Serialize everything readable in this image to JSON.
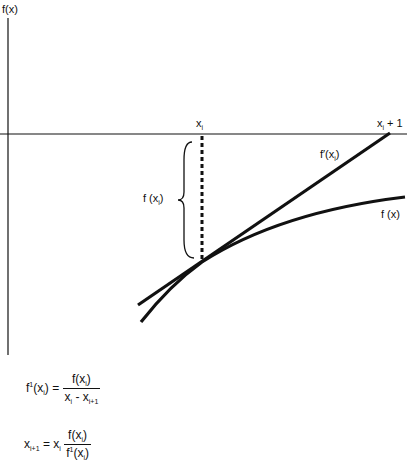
{
  "axes": {
    "y_label": "f(x)",
    "x_label_xi": "x",
    "x_label_xi_sub": "i",
    "x_label_xi1": "x",
    "x_label_xi1_sub": "i",
    "x_label_xi1_suffix": " + 1"
  },
  "labels": {
    "tangent": "f′(x",
    "tangent_sub": "i",
    "tangent_close": ")",
    "curve": "f (x)",
    "brace": "f (x",
    "brace_sub": "i",
    "brace_close": ")"
  },
  "equations": {
    "eq1": {
      "lhs": "f",
      "lhs_sup": "1",
      "lhs_arg": "(x",
      "lhs_sub": "i",
      "lhs_close": ") =",
      "num": "f(x",
      "num_sub": "i",
      "num_close": ")",
      "den_a": "x",
      "den_a_sub": "i",
      "den_minus": " - x",
      "den_b_sub": "i+1"
    },
    "eq2": {
      "lhs": "x",
      "lhs_sub": "i+1",
      "eq": " = x",
      "rhs_sub": "i",
      "num": "f(x",
      "num_sub": "i",
      "num_close": ")",
      "den": "f",
      "den_sup": "1",
      "den_arg": "(x",
      "den_sub": "i",
      "den_close": ")"
    }
  },
  "colors": {
    "ink": "#111111",
    "background": "#ffffff"
  }
}
